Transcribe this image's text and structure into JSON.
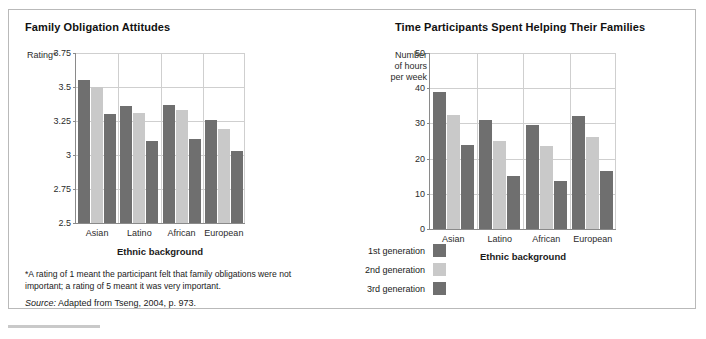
{
  "figure": {
    "footnote": "*A rating of 1 meant the participant felt that family obligations were not important; a rating of 5 meant it was very important.",
    "source_prefix": "Source:",
    "source_text": "Adapted from Tseng, 2004, p. 973."
  },
  "legend": {
    "position": "bottom-center",
    "items": [
      {
        "label": "1st generation",
        "color": "#6f6f6f"
      },
      {
        "label": "2nd generation",
        "color": "#c9c9c9"
      },
      {
        "label": "3rd generation",
        "color": "#6f6f6f"
      }
    ]
  },
  "colors": {
    "series_1": "#6f6f6f",
    "series_2": "#c9c9c9",
    "series_3": "#6f6f6f",
    "grid": "#cfcfcf",
    "axis": "#8a8a8a",
    "frame": "#b9b9b9"
  },
  "chart_data": [
    {
      "type": "bar",
      "title": "Family Obligation Attitudes",
      "xlabel": "Ethnic background",
      "ylabel": "Rating*",
      "categories": [
        "Asian",
        "Latino",
        "African",
        "European"
      ],
      "series": [
        {
          "name": "1st generation",
          "values": [
            3.55,
            3.36,
            3.37,
            3.26
          ]
        },
        {
          "name": "2nd generation",
          "values": [
            3.5,
            3.31,
            3.33,
            3.19
          ]
        },
        {
          "name": "3rd generation",
          "values": [
            3.3,
            3.1,
            3.12,
            3.03
          ]
        }
      ],
      "ylim": [
        2.5,
        3.75
      ],
      "yticks": [
        2.5,
        2.75,
        3,
        3.25,
        3.5,
        3.75
      ],
      "ytick_labels": [
        "2.5",
        "2.75",
        "3",
        "3.25",
        "3.5",
        "3.75"
      ],
      "grid": true,
      "legend": "bottom-center"
    },
    {
      "type": "bar",
      "title": "Time Participants Spent Helping Their Families",
      "xlabel": "Ethnic background",
      "ylabel": "Number of hours per week",
      "ylabel_lines": [
        "Number",
        "of hours",
        "per week"
      ],
      "categories": [
        "Asian",
        "Latino",
        "African",
        "European"
      ],
      "series": [
        {
          "name": "1st generation",
          "values": [
            39,
            31,
            29.5,
            32
          ]
        },
        {
          "name": "2nd generation",
          "values": [
            32.5,
            25,
            23.5,
            26
          ]
        },
        {
          "name": "3rd generation",
          "values": [
            24,
            15,
            13.5,
            16.5
          ]
        }
      ],
      "ylim": [
        0,
        50
      ],
      "yticks": [
        0,
        10,
        20,
        30,
        40,
        50
      ],
      "ytick_labels": [
        "0",
        "10",
        "20",
        "30",
        "40",
        "50"
      ],
      "grid": true,
      "legend": "bottom-center"
    }
  ]
}
